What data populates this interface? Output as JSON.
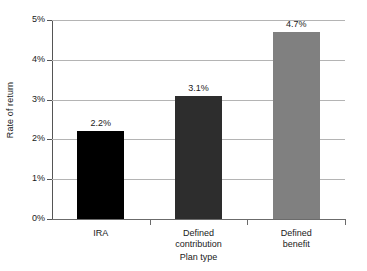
{
  "chart_data": {
    "type": "bar",
    "title": "",
    "xlabel": "Plan type",
    "ylabel": "Rate of return",
    "categories": [
      "IRA",
      "Defined contribution",
      "Defined benefit"
    ],
    "category_lines": [
      [
        "IRA"
      ],
      [
        "Defined",
        "contribution"
      ],
      [
        "Defined",
        "benefit"
      ]
    ],
    "values": [
      2.2,
      3.1,
      4.7
    ],
    "data_labels": [
      "2.2%",
      "3.1%",
      "4.7%"
    ],
    "ylim": [
      0,
      5
    ],
    "ytick_values": [
      0,
      1,
      2,
      3,
      4,
      5
    ],
    "ytick_labels": [
      "0%",
      "1%",
      "2%",
      "3%",
      "4%",
      "5%"
    ],
    "grid": true,
    "legend": false,
    "bar_colors": [
      "#000000",
      "#2d2d2d",
      "#808080"
    ],
    "gridline_color": "#b4b4b4",
    "axis_color": "#555555",
    "background": "#ffffff"
  }
}
